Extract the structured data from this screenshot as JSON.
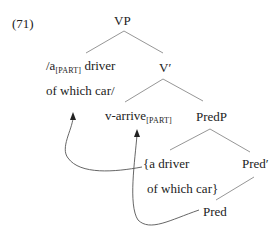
{
  "example_number": "(71)",
  "nodes": {
    "vp": "VP",
    "spec": {
      "line1_pre": "/a",
      "line1_sub": "[PART]",
      "line1_post": " driver",
      "line2": "of which car/"
    },
    "vbar": "V′",
    "v_arrive": {
      "pre": "v-arrive",
      "sub": "[PART]"
    },
    "predp": "PredP",
    "subject": {
      "line1": "{a driver",
      "line2": "of which car}"
    },
    "predbar": "Pred′",
    "pred": "Pred"
  },
  "colors": {
    "lines": "#888888",
    "arrows": "#555555",
    "text": "#222222"
  }
}
